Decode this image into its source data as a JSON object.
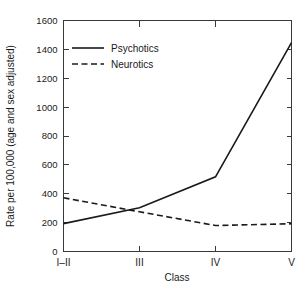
{
  "chart_data": {
    "type": "line",
    "title": "",
    "xlabel": "Class",
    "ylabel": "Rate per 100,000 (age and sex adjusted)",
    "categories": [
      "I–II",
      "III",
      "IV",
      "V"
    ],
    "series": [
      {
        "name": "Psychotics",
        "style": "solid",
        "values": [
          193,
          303,
          517,
          1447
        ]
      },
      {
        "name": "Neurotics",
        "style": "dashed",
        "values": [
          372,
          275,
          180,
          192
        ]
      }
    ],
    "ylim": [
      0,
      1600
    ],
    "xlim": [
      0,
      3
    ],
    "yticks": [
      0,
      200,
      400,
      600,
      800,
      1000,
      1200,
      1400,
      1600
    ],
    "ytick_labels": [
      "0",
      "200",
      "400",
      "600",
      "800",
      "1000",
      "1200",
      "1400",
      "1600"
    ],
    "xtick_labels": [
      "I–II",
      "III",
      "IV",
      "V"
    ],
    "grid": false,
    "legend_position": "upper left",
    "frame": "box",
    "colors": {
      "line": "#1a1a1a",
      "axis": "#3a3a3a",
      "background": "#ffffff"
    }
  },
  "legend": {
    "entries": [
      {
        "label": "Psychotics",
        "style": "solid"
      },
      {
        "label": "Neurotics",
        "style": "dashed"
      }
    ]
  }
}
